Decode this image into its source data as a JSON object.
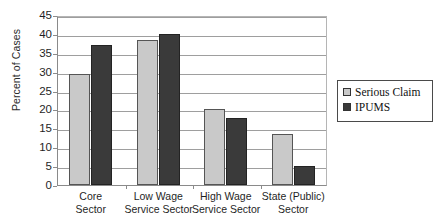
{
  "chart_data": {
    "type": "bar",
    "title": "",
    "xlabel": "",
    "ylabel": "Percent of Cases",
    "ylim": [
      0,
      45
    ],
    "ytick_step": 5,
    "yticks": [
      45,
      40,
      35,
      30,
      25,
      20,
      15,
      10,
      5,
      0
    ],
    "grid": true,
    "legend_position": "right",
    "categories": [
      "Core Sector",
      "Low Wage Service Sector",
      "High Wage Service Sector",
      "State (Public) Sector"
    ],
    "category_lines": [
      [
        "Core",
        "Sector"
      ],
      [
        "Low Wage",
        "Service Sector"
      ],
      [
        "High Wage",
        "Service Sector"
      ],
      [
        "State (Public)",
        "Sector"
      ]
    ],
    "series": [
      {
        "name": "Serious Claim",
        "color": "#c9c9c9",
        "values": [
          29.5,
          38.5,
          20.0,
          13.4
        ]
      },
      {
        "name": "IPUMS",
        "color": "#3a3a3a",
        "values": [
          37.0,
          40.0,
          17.7,
          5.0
        ]
      }
    ]
  },
  "legend": {
    "items": [
      {
        "label": "Serious Claim",
        "color": "#c9c9c9"
      },
      {
        "label": "IPUMS",
        "color": "#3a3a3a"
      }
    ]
  },
  "axes": {
    "y_title": "Percent of Cases"
  }
}
